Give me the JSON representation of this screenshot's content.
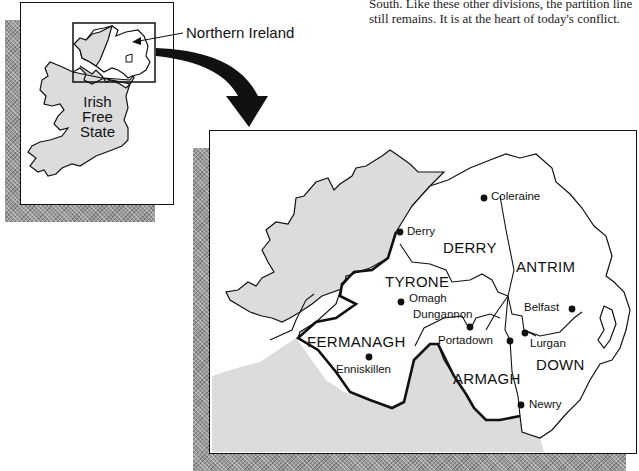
{
  "caption": {
    "lines": [
      "South. Like these other divisions, the partition line",
      "still remains. It is at the heart of today's conflict."
    ]
  },
  "inset_map": {
    "callout_label": "Northern Ireland",
    "region_label_lines": [
      "Irish",
      "Free",
      "State"
    ]
  },
  "detail_map": {
    "counties": [
      {
        "name": "DERRY"
      },
      {
        "name": "ANTRIM"
      },
      {
        "name": "TYRONE"
      },
      {
        "name": "FERMANAGH"
      },
      {
        "name": "ARMAGH"
      },
      {
        "name": "DOWN"
      }
    ],
    "towns": [
      {
        "name": "Coleraine"
      },
      {
        "name": "Derry"
      },
      {
        "name": "Omagh"
      },
      {
        "name": "Dungannon"
      },
      {
        "name": "Belfast"
      },
      {
        "name": "Portadown"
      },
      {
        "name": "Lurgan"
      },
      {
        "name": "Enniskillen"
      },
      {
        "name": "Newry"
      }
    ]
  },
  "colors": {
    "ink": "#111111",
    "free_state_fill": "#dcdcdc",
    "shadow": "#9a9a9a"
  }
}
